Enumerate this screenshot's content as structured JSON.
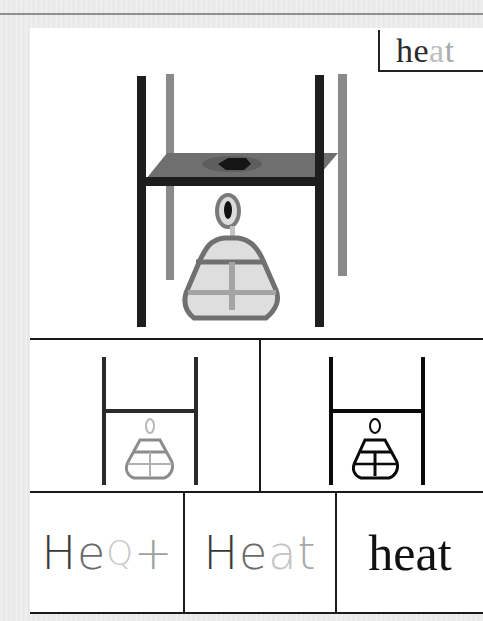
{
  "title_label": {
    "parts": [
      {
        "text": "he",
        "color": "#2a2a2a"
      },
      {
        "text": "a",
        "color": "#bdbdbd"
      },
      {
        "text": "t",
        "color": "#a9a9a9"
      }
    ]
  },
  "main_illustration": {
    "description": "tripod stand with plate over alcohol lamp (heat)",
    "colors": {
      "dark": "#1e1e1e",
      "gray": "#8a8a8a",
      "plate": "#707070",
      "flask_fill": "#dcdcdc",
      "flask_outline": "#6e6e6e"
    }
  },
  "middle_panels": [
    {
      "name": "glyph-gray",
      "colors": {
        "frame": "#2b2b2b",
        "lamp": "#8c8c8c",
        "wick": "#b8b8b8"
      }
    },
    {
      "name": "glyph-black",
      "colors": {
        "frame": "#0a0a0a",
        "lamp": "#0a0a0a",
        "wick": "#0a0a0a"
      }
    }
  ],
  "word_panels": [
    {
      "style": "stylized",
      "parts": [
        {
          "text": "H",
          "color": "#3a3a3a"
        },
        {
          "text": "e",
          "color": "#6a6a6a"
        },
        {
          "text": "Q",
          "color": "#c8c8c8"
        },
        {
          "text": "+",
          "color": "#a0a0a0"
        }
      ]
    },
    {
      "style": "handwritten",
      "parts": [
        {
          "text": "H",
          "color": "#3a3a3a"
        },
        {
          "text": "e",
          "color": "#6a6a6a"
        },
        {
          "text": "a",
          "color": "#c4c4c4"
        },
        {
          "text": "t",
          "color": "#a8a8a8"
        }
      ]
    },
    {
      "style": "print",
      "parts": [
        {
          "text": "heat",
          "color": "#111111"
        }
      ]
    }
  ]
}
